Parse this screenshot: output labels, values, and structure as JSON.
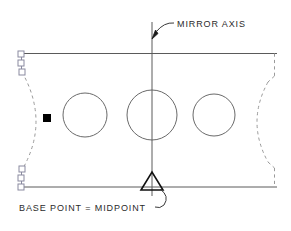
{
  "figure": {
    "background_color": "#ffffff",
    "line_color": "#5a5a5a",
    "dark_line_color": "#111111",
    "text_color": "#2b2b2b",
    "grip_color": "#8a8aa0",
    "base_point_color": "#000000"
  },
  "annotations": {
    "mirror_axis_label": "MIRROR  AXIS",
    "base_point_label": "BASE  POINT  =  MIDPOINT"
  },
  "geometry": {
    "plate": {
      "left": 20,
      "right": 277,
      "top": 53,
      "bottom": 187,
      "description": "Rectangular plate outline"
    },
    "mirror_axis": {
      "x": 152,
      "y_top": 22,
      "y_bottom": 196,
      "description": "Vertical mirror axis line"
    },
    "circles": [
      {
        "cx": 85,
        "cy": 115,
        "r": 22
      },
      {
        "cx": 152,
        "cy": 115,
        "r": 25
      },
      {
        "cx": 214,
        "cy": 115,
        "r": 21
      }
    ],
    "left_arc": {
      "description": "Dashed concave arc on left edge",
      "top_x": 22,
      "top_y": 72,
      "ctrl_x": 48,
      "ctrl_y": 122,
      "bot_x": 22,
      "bot_y": 172
    },
    "right_arc": {
      "description": "Dashed concave arc on right edge",
      "top_x": 274,
      "top_y": 75,
      "ctrl_x": 250,
      "ctrl_y": 122,
      "bot_x": 274,
      "bot_y": 170
    },
    "base_point_marker": {
      "x": 47,
      "y": 118,
      "size": 7
    },
    "midpoint_marker": {
      "cx": 152,
      "cy": 182,
      "half_width": 11,
      "height": 17
    },
    "grips_top_left": [
      {
        "x": 21,
        "y": 54
      },
      {
        "x": 21,
        "y": 63
      },
      {
        "x": 22,
        "y": 72
      }
    ],
    "grips_bottom_left": [
      {
        "x": 22,
        "y": 169
      },
      {
        "x": 21,
        "y": 178
      },
      {
        "x": 21,
        "y": 187
      }
    ]
  },
  "leaders": {
    "mirror_axis_leader": {
      "arrow_tip_x": 152,
      "arrow_tip_y": 38,
      "curve_end_x": 172,
      "curve_end_y": 24
    },
    "base_point_leader": {
      "start_x": 160,
      "start_y": 186,
      "end_x": 152,
      "end_y": 205
    }
  }
}
